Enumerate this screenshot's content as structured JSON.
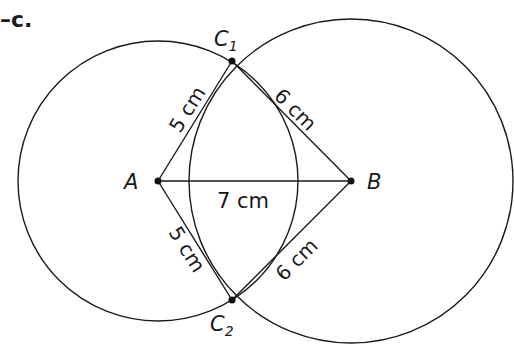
{
  "figure": {
    "label": "–c.",
    "points": {
      "A": {
        "name": "A",
        "x": 158,
        "y": 181
      },
      "B": {
        "name": "B",
        "x": 351,
        "y": 181
      },
      "C1": {
        "name": "C",
        "sub": "1",
        "x": 232,
        "y": 61
      },
      "C2": {
        "name": "C",
        "sub": "2",
        "x": 232,
        "y": 300
      }
    },
    "circles": [
      {
        "center": "A",
        "r": 140
      },
      {
        "center": "B",
        "r": 162
      }
    ],
    "segments": {
      "AB": "7 cm",
      "AC1": "5 cm",
      "BC1": "6 cm",
      "AC2": "5 cm",
      "BC2": "6 cm"
    },
    "stroke_color": "#1a1a1a"
  }
}
